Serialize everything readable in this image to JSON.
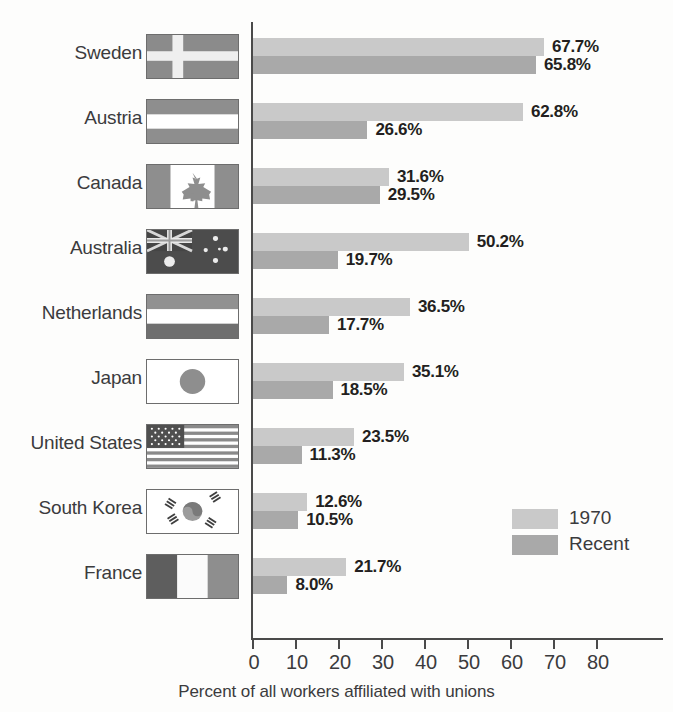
{
  "chart_data": {
    "type": "bar",
    "orientation": "horizontal",
    "title": "",
    "xlabel": "Percent of all workers affiliated with unions",
    "ylabel": "",
    "xlim": [
      0,
      85
    ],
    "xticks": [
      "0",
      "10",
      "20",
      "30",
      "40",
      "50",
      "60",
      "70",
      "80"
    ],
    "xtick_values": [
      0,
      10,
      20,
      30,
      40,
      50,
      60,
      70,
      80
    ],
    "grid": false,
    "legend_position": "middle-right",
    "categories": [
      "Sweden",
      "Austria",
      "Canada",
      "Australia",
      "Netherlands",
      "Japan",
      "United States",
      "South Korea",
      "France"
    ],
    "series": [
      {
        "name": "1970",
        "color": "#c9c9c9",
        "values": [
          67.7,
          62.8,
          31.6,
          50.2,
          36.5,
          35.1,
          23.5,
          12.6,
          21.7
        ],
        "labels": [
          "67.7%",
          "62.8%",
          "31.6%",
          "50.2%",
          "36.5%",
          "35.1%",
          "23.5%",
          "12.6%",
          "21.7%"
        ]
      },
      {
        "name": "Recent",
        "color": "#a9a9a9",
        "values": [
          65.8,
          26.6,
          29.5,
          19.7,
          17.7,
          18.5,
          11.3,
          10.5,
          8.0
        ],
        "labels": [
          "65.8%",
          "26.6%",
          "29.5%",
          "19.7%",
          "17.7%",
          "18.5%",
          "11.3%",
          "10.5%",
          "8.0%"
        ]
      }
    ]
  },
  "rows": [
    {
      "country": "Sweden",
      "flag": "flag-sweden",
      "v1970": 67.7,
      "l1970": "67.7%",
      "vrecent": 65.8,
      "lrecent": "65.8%"
    },
    {
      "country": "Austria",
      "flag": "flag-austria",
      "v1970": 62.8,
      "l1970": "62.8%",
      "vrecent": 26.6,
      "lrecent": "26.6%"
    },
    {
      "country": "Canada",
      "flag": "flag-canada",
      "v1970": 31.6,
      "l1970": "31.6%",
      "vrecent": 29.5,
      "lrecent": "29.5%"
    },
    {
      "country": "Australia",
      "flag": "flag-australia",
      "v1970": 50.2,
      "l1970": "50.2%",
      "vrecent": 19.7,
      "lrecent": "19.7%"
    },
    {
      "country": "Netherlands",
      "flag": "flag-netherlands",
      "v1970": 36.5,
      "l1970": "36.5%",
      "vrecent": 17.7,
      "lrecent": "17.7%"
    },
    {
      "country": "Japan",
      "flag": "flag-japan",
      "v1970": 35.1,
      "l1970": "35.1%",
      "vrecent": 18.5,
      "lrecent": "18.5%"
    },
    {
      "country": "United States",
      "flag": "flag-united-states",
      "v1970": 23.5,
      "l1970": "23.5%",
      "vrecent": 11.3,
      "lrecent": "11.3%"
    },
    {
      "country": "South Korea",
      "flag": "flag-south-korea",
      "v1970": 12.6,
      "l1970": "12.6%",
      "vrecent": 10.5,
      "lrecent": "10.5%"
    },
    {
      "country": "France",
      "flag": "flag-france",
      "v1970": 21.7,
      "l1970": "21.7%",
      "vrecent": 8.0,
      "lrecent": "8.0%"
    }
  ],
  "axis": {
    "ticks": [
      "0",
      "10",
      "20",
      "30",
      "40",
      "50",
      "60",
      "70",
      "80"
    ],
    "title": "Percent of all workers affiliated with unions"
  },
  "legend": {
    "items": [
      {
        "label": "1970",
        "color": "#c9c9c9"
      },
      {
        "label": "Recent",
        "color": "#a9a9a9"
      }
    ]
  },
  "colors": {
    "series_1970": "#c9c9c9",
    "series_recent": "#a9a9a9",
    "axis": "#4a4a4a",
    "text": "#3b3b3d",
    "value_text": "#231f20",
    "background": "#fdfdfc"
  },
  "geometry": {
    "axis_x_px": 253,
    "px_per_unit": 4.3,
    "row_top_px": 30,
    "row_pitch_px": 65
  }
}
